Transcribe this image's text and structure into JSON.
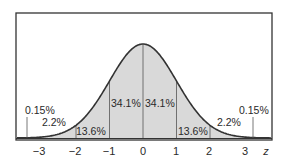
{
  "chart_data": {
    "type": "area",
    "title": "",
    "xlabel": "z",
    "ylabel": "",
    "distribution": "standard normal",
    "xlim": [
      -3.7,
      3.7
    ],
    "grid": false,
    "legend": null,
    "ticks": [
      {
        "value": -3,
        "label": "−3"
      },
      {
        "value": -2,
        "label": "−2"
      },
      {
        "value": -1,
        "label": "−1"
      },
      {
        "value": 0,
        "label": "0"
      },
      {
        "value": 1,
        "label": "1"
      },
      {
        "value": 2,
        "label": "2"
      },
      {
        "value": 3,
        "label": "3"
      }
    ],
    "regions": [
      {
        "from": -4,
        "to": -3,
        "percent": 0.15,
        "label": "0.15%"
      },
      {
        "from": -3,
        "to": -2,
        "percent": 2.2,
        "label": "2.2%"
      },
      {
        "from": -2,
        "to": -1,
        "percent": 13.6,
        "label": "13.6%"
      },
      {
        "from": -1,
        "to": 0,
        "percent": 34.1,
        "label": "34.1%"
      },
      {
        "from": 0,
        "to": 1,
        "percent": 34.1,
        "label": "34.1%"
      },
      {
        "from": 1,
        "to": 2,
        "percent": 13.6,
        "label": "13.6%"
      },
      {
        "from": 2,
        "to": 3,
        "percent": 2.2,
        "label": "2.2%"
      },
      {
        "from": 3,
        "to": 4,
        "percent": 0.15,
        "label": "0.15%"
      }
    ],
    "colors": {
      "fill": "#d9d9d9",
      "curve": "#333333",
      "frame": "#333333",
      "divider": "#555555"
    }
  }
}
